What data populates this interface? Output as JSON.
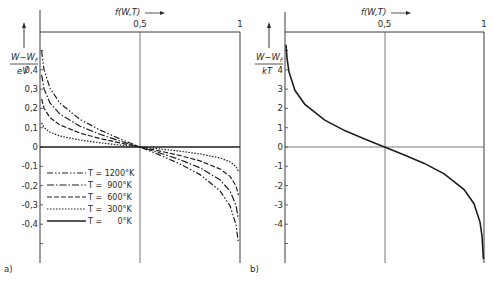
{
  "chart_data": [
    {
      "panel": "a)",
      "type": "line",
      "title": "",
      "xlabel": "f(W,T) →",
      "ylabel_num": "W − W_F",
      "ylabel_den": "eV",
      "x_ticks": [
        "0,5",
        "1"
      ],
      "x_tick_values": [
        0.5,
        1
      ],
      "y_ticks": [
        "0,4",
        "0,3",
        "0,2",
        "0,1",
        "0",
        "-0,1",
        "-0,2",
        "-0,3",
        "-0,4"
      ],
      "y_tick_values": [
        0.4,
        0.3,
        0.2,
        0.1,
        0,
        -0.1,
        -0.2,
        -0.3,
        -0.4
      ],
      "xlim": [
        0,
        1
      ],
      "ylim": [
        -0.55,
        0.6
      ],
      "grid": false,
      "legend_position": "lower-left inside",
      "x": [
        0.008,
        0.02,
        0.05,
        0.1,
        0.2,
        0.3,
        0.4,
        0.5,
        0.6,
        0.7,
        0.8,
        0.9,
        0.95,
        0.98,
        0.992
      ],
      "series": [
        {
          "name": "T = 1200°K",
          "label": "T = 1200°K",
          "dash": "6,2,1.5,2,1.5,2",
          "values": [
            0.498,
            0.402,
            0.304,
            0.227,
            0.143,
            0.088,
            0.042,
            0.0,
            -0.042,
            -0.088,
            -0.143,
            -0.227,
            -0.304,
            -0.402,
            -0.498
          ]
        },
        {
          "name": "T = 900°K",
          "label": "T =  900°K",
          "dash": "7,2,1.5,2",
          "values": [
            0.374,
            0.302,
            0.228,
            0.17,
            0.108,
            0.066,
            0.031,
            0.0,
            -0.031,
            -0.066,
            -0.108,
            -0.17,
            -0.228,
            -0.302,
            -0.374
          ]
        },
        {
          "name": "T = 600°K",
          "label": "T =  600°K",
          "dash": "5,2",
          "values": [
            0.249,
            0.201,
            0.152,
            0.114,
            0.072,
            0.044,
            0.021,
            0.0,
            -0.021,
            -0.044,
            -0.072,
            -0.114,
            -0.152,
            -0.201,
            -0.249
          ]
        },
        {
          "name": "T = 300°K",
          "label": "T =  300°K",
          "dash": "1.5,1.5",
          "values": [
            0.125,
            0.101,
            0.076,
            0.057,
            0.036,
            0.022,
            0.01,
            0.0,
            -0.01,
            -0.022,
            -0.036,
            -0.057,
            -0.076,
            -0.101,
            -0.125
          ]
        },
        {
          "name": "T = 0°K",
          "label": "T =      0°K",
          "dash": "",
          "values": [
            0,
            0,
            0,
            0,
            0,
            0,
            0,
            0,
            0,
            0,
            0,
            0,
            0,
            0,
            0
          ]
        }
      ],
      "annotation": "a)"
    },
    {
      "panel": "b)",
      "type": "line",
      "title": "",
      "xlabel": "f(W,T) →",
      "ylabel_num": "W − W_F",
      "ylabel_den": "kT",
      "x_ticks": [
        "0,5",
        "1"
      ],
      "x_tick_values": [
        0.5,
        1
      ],
      "y_ticks": [
        "4",
        "3",
        "2",
        "1",
        "0",
        "-1",
        "-2",
        "-3",
        "-4"
      ],
      "y_tick_values": [
        4,
        3,
        2,
        1,
        0,
        -1,
        -2,
        -3,
        -4
      ],
      "xlim": [
        0,
        1
      ],
      "ylim": [
        -5.8,
        5.6
      ],
      "grid": false,
      "x": [
        0.005,
        0.01,
        0.02,
        0.05,
        0.1,
        0.2,
        0.3,
        0.4,
        0.5,
        0.6,
        0.7,
        0.8,
        0.9,
        0.95,
        0.98,
        0.99,
        0.997
      ],
      "series": [
        {
          "name": "W−W_F / kT",
          "dash": "",
          "values": [
            5.29,
            4.6,
            3.89,
            2.94,
            2.2,
            1.39,
            0.85,
            0.41,
            0.0,
            -0.41,
            -0.85,
            -1.39,
            -2.2,
            -2.94,
            -3.89,
            -4.6,
            -5.81
          ]
        }
      ],
      "annotation": "b)"
    }
  ]
}
